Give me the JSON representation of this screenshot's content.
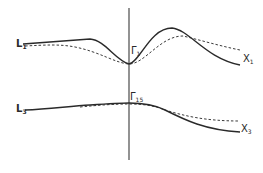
{
  "diagram": {
    "type": "band-structure-sketch",
    "axis": {
      "x": 129,
      "y_top": 8,
      "y_bottom": 160
    },
    "upper_band": {
      "left_label": {
        "main": "L",
        "sub": "1"
      },
      "center_label": {
        "main": "Γ",
        "sub": "1"
      },
      "right_label": {
        "main": "X",
        "sub": "1"
      },
      "solid_path": "M23,44 C50,42 75,40 90,39 C105,40 115,60 129,64 C140,62 150,28 172,28 C190,30 205,58 240,65",
      "dashed_path": "M25,46 C45,45 60,44 75,47 C100,52 115,63 129,64 C145,64 160,36 183,36 C200,40 220,46 240,50"
    },
    "lower_band": {
      "left_label": {
        "main": "L",
        "sub": "3"
      },
      "center_label": {
        "main": "Γ",
        "sub": "15"
      },
      "right_label": {
        "main": "X",
        "sub": "3"
      },
      "solid_path": "M25,110 C50,109 70,106 90,105 C105,104 120,103 129,103 C145,103 155,105 165,110 C185,120 205,130 240,132",
      "dashed_path": "M80,107 C100,105 115,104 129,104 C145,104 155,106 165,110 C185,116 205,121 240,121"
    },
    "colors": {
      "line": "#2a2a2a",
      "background": "#ffffff"
    }
  }
}
